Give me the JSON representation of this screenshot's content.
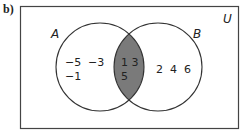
{
  "part_label": "b)",
  "universal_label": "U",
  "sets": [
    {
      "name": "A",
      "only_elements": [
        "−5",
        "−3",
        "−1"
      ]
    },
    {
      "name": "B",
      "only_elements": [
        "2",
        "4",
        "6"
      ]
    }
  ],
  "intersection": {
    "elements": [
      "1",
      "3",
      "5"
    ],
    "shaded": true,
    "fill_color": "#7a7a7a"
  },
  "labels": {
    "set_a": "A",
    "set_b": "B",
    "a_row1_first": "−5",
    "a_row1_second": "−3",
    "a_row2": "−1",
    "int_row1": "1 3",
    "int_row2": "5",
    "b_row": "2  4  6"
  },
  "colors": {
    "stroke": "#333333",
    "shade": "#7a7a7a",
    "background": "#ffffff"
  }
}
